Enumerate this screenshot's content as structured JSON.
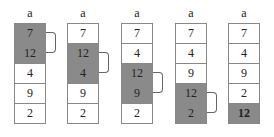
{
  "steps": [
    {
      "label": "a",
      "values": [
        "7",
        "12",
        "4",
        "9",
        "2"
      ],
      "highlighted": [
        0,
        1
      ],
      "bold": []
    },
    {
      "label": "a",
      "values": [
        "7",
        "12",
        "4",
        "9",
        "2"
      ],
      "highlighted": [
        1,
        2
      ],
      "bold": []
    },
    {
      "label": "a",
      "values": [
        "7",
        "4",
        "12",
        "9",
        "2"
      ],
      "highlighted": [
        2,
        3
      ],
      "bold": []
    },
    {
      "label": "a",
      "values": [
        "7",
        "4",
        "9",
        "12",
        "2"
      ],
      "highlighted": [
        3,
        4
      ],
      "bold": []
    },
    {
      "label": "a",
      "values": [
        "7",
        "4",
        "9",
        "2",
        "12"
      ],
      "highlighted": [
        4
      ],
      "bold": [
        4
      ]
    }
  ],
  "colors": {
    "highlight": "#8a8a8a",
    "border": "#888888"
  }
}
